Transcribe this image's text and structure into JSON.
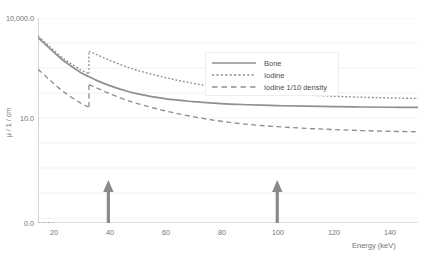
{
  "chart_data": {
    "type": "line",
    "title": "",
    "xlabel": "Energy (keV)",
    "ylabel": "µ / 1 / cm",
    "xlim": [
      15,
      150
    ],
    "ylim": [
      0.0,
      10000.0
    ],
    "yscale": "log",
    "grid": true,
    "legend_position": "upper-right",
    "xticks": [
      "20",
      "40",
      "60",
      "80",
      "100",
      "120",
      "140"
    ],
    "xtick_values": [
      20,
      40,
      60,
      80,
      100,
      120,
      140
    ],
    "yticks": [
      "10,000.0",
      "10.0",
      "0.0"
    ],
    "ytick_values": [
      10000.0,
      10.0,
      0.0
    ],
    "series": [
      {
        "name": "Bone",
        "style": "solid",
        "color": "#8f8f8f",
        "x": [
          15,
          18,
          20,
          23,
          26,
          30,
          33,
          36,
          40,
          45,
          50,
          60,
          70,
          80,
          90,
          100,
          110,
          120,
          130,
          140,
          150
        ],
        "values": [
          2600,
          1500,
          1050,
          620,
          400,
          235,
          175,
          132,
          97,
          70,
          54,
          38,
          31,
          27,
          25,
          23.5,
          22.6,
          21.9,
          21.4,
          21.0,
          20.7
        ]
      },
      {
        "name": "Iodine",
        "style": "dotted",
        "color": "#8f8f8f",
        "x": [
          15,
          18,
          20,
          23,
          26,
          30,
          32.9,
          33.1,
          36,
          40,
          45,
          50,
          60,
          70,
          80,
          90,
          100,
          110,
          120,
          130,
          140,
          150
        ],
        "values": [
          2900,
          1700,
          1200,
          720,
          470,
          285,
          215,
          1000,
          790,
          560,
          380,
          275,
          165,
          110,
          80,
          64,
          55,
          49,
          45,
          42,
          40,
          38.5
        ]
      },
      {
        "name": "Iodine 1/10 density",
        "style": "dashed",
        "color": "#8f8f8f",
        "x": [
          15,
          18,
          20,
          23,
          26,
          30,
          32.9,
          33.1,
          36,
          40,
          45,
          50,
          60,
          70,
          80,
          90,
          100,
          110,
          120,
          130,
          140,
          150
        ],
        "values": [
          290,
          170,
          120,
          72,
          47,
          28.5,
          21.5,
          100,
          79,
          56,
          38,
          27.5,
          16.5,
          11.0,
          8.0,
          6.4,
          5.5,
          4.9,
          4.5,
          4.2,
          4.0,
          3.85
        ]
      }
    ],
    "annotations": [
      {
        "name": "arrow-40kev",
        "type": "up-arrow",
        "x": 40,
        "color": "#8a8a8a"
      },
      {
        "name": "arrow-100kev",
        "type": "up-arrow",
        "x": 100,
        "color": "#8a8a8a"
      }
    ]
  },
  "caption": ""
}
